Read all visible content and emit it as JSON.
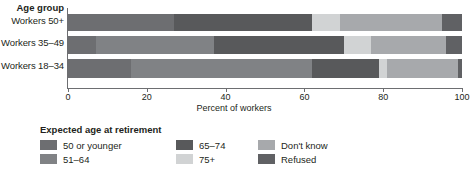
{
  "chart_data": {
    "type": "bar",
    "orientation": "horizontal",
    "stacked": true,
    "stacked_normalized": true,
    "title": "",
    "xlabel": "Percent of workers",
    "ylabel": "Age group",
    "xlim": [
      0,
      100
    ],
    "xticks": [
      0,
      20,
      40,
      60,
      80,
      100
    ],
    "xticklabels": [
      "0",
      "20",
      "40",
      "60",
      "80",
      "100"
    ],
    "grid": false,
    "legend_position": "bottom-left",
    "legend_title": "Expected age at retirement",
    "categories": [
      "Workers 50+",
      "Workers 35–49",
      "Workers 18–34"
    ],
    "series": [
      {
        "name": "50 or younger",
        "color": "#6d6e71",
        "values": [
          27,
          7,
          16
        ]
      },
      {
        "name": "51–64",
        "color": "#808285",
        "values": [
          0,
          30,
          46
        ]
      },
      {
        "name": "65–74",
        "color": "#58595b",
        "values": [
          35,
          33,
          17
        ]
      },
      {
        "name": "75+",
        "color": "#d1d3d4",
        "values": [
          7,
          7,
          2
        ]
      },
      {
        "name": "Don't know",
        "color": "#a7a9ac",
        "values": [
          26,
          19,
          18
        ]
      },
      {
        "name": "Refused",
        "color": "#606164",
        "values": [
          5,
          4,
          1
        ]
      }
    ]
  },
  "axis": {
    "y_title": "Age group",
    "x_title": "Percent of workers"
  },
  "legend": {
    "title": "Expected age at retirement",
    "items": [
      {
        "label": "50 or younger",
        "color": "#6d6e71"
      },
      {
        "label": "51–64",
        "color": "#808285"
      },
      {
        "label": "65–74",
        "color": "#58595b"
      },
      {
        "label": "75+",
        "color": "#d1d3d4"
      },
      {
        "label": "Don't know",
        "color": "#a7a9ac"
      },
      {
        "label": "Refused",
        "color": "#606164"
      }
    ]
  },
  "bars": [
    {
      "category": "Workers 50+",
      "segments": [
        {
          "series": "50 or younger",
          "start": 0,
          "end": 27,
          "color": "#6d6e71"
        },
        {
          "series": "65–74",
          "start": 27,
          "end": 62,
          "color": "#58595b"
        },
        {
          "series": "75+",
          "start": 62,
          "end": 69,
          "color": "#d1d3d4"
        },
        {
          "series": "Don't know",
          "start": 69,
          "end": 95,
          "color": "#a7a9ac"
        },
        {
          "series": "Refused",
          "start": 95,
          "end": 100,
          "color": "#606164"
        }
      ]
    },
    {
      "category": "Workers 35–49",
      "segments": [
        {
          "series": "50 or younger",
          "start": 0,
          "end": 7,
          "color": "#6d6e71"
        },
        {
          "series": "51–64",
          "start": 7,
          "end": 37,
          "color": "#808285"
        },
        {
          "series": "65–74",
          "start": 37,
          "end": 70,
          "color": "#58595b"
        },
        {
          "series": "75+",
          "start": 70,
          "end": 77,
          "color": "#d1d3d4"
        },
        {
          "series": "Don't know",
          "start": 77,
          "end": 96,
          "color": "#a7a9ac"
        },
        {
          "series": "Refused",
          "start": 96,
          "end": 100,
          "color": "#606164"
        }
      ]
    },
    {
      "category": "Workers 18–34",
      "segments": [
        {
          "series": "50 or younger",
          "start": 0,
          "end": 16,
          "color": "#6d6e71"
        },
        {
          "series": "51–64",
          "start": 16,
          "end": 62,
          "color": "#808285"
        },
        {
          "series": "65–74",
          "start": 62,
          "end": 79,
          "color": "#58595b"
        },
        {
          "series": "75+",
          "start": 79,
          "end": 81,
          "color": "#d1d3d4"
        },
        {
          "series": "Don't know",
          "start": 81,
          "end": 99,
          "color": "#a7a9ac"
        },
        {
          "series": "Refused",
          "start": 99,
          "end": 100,
          "color": "#606164"
        }
      ]
    }
  ]
}
